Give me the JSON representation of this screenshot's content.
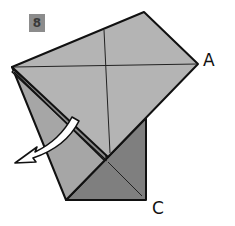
{
  "step": {
    "number": "8"
  },
  "labels": {
    "corner_a": "A",
    "corner_c": "C"
  },
  "colors": {
    "paper_light": "#b4b4b4",
    "paper_dark": "#7f7f7f",
    "paper_mid": "#9a9a9a",
    "outline": "#111111",
    "badge_bg": "#8c8c8c",
    "arrow_fill": "#ffffff"
  },
  "diagram": {
    "arrow_direction": "down-left"
  }
}
